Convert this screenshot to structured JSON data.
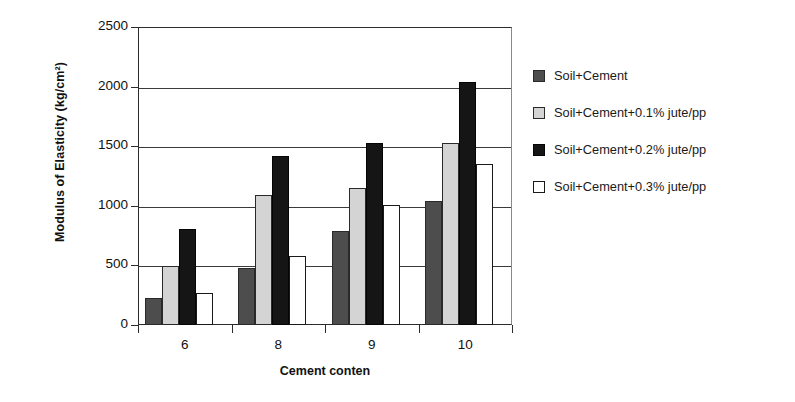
{
  "chart_data": {
    "type": "bar",
    "title": "",
    "xlabel": "Cement conten",
    "ylabel": "Modulus of Elasticity (kg/cm²)",
    "categories": [
      "6",
      "8",
      "9",
      "10"
    ],
    "ylim": [
      0,
      2500
    ],
    "yticks": [
      0,
      500,
      1000,
      1500,
      2000,
      2500
    ],
    "ytick_labels": [
      "0",
      "500",
      "1000",
      "1500",
      "2000",
      "2500"
    ],
    "grid": "horizontal",
    "legend_position": "right",
    "series": [
      {
        "name": "Soil+Cement",
        "color": "#4d4d4d",
        "values": [
          225,
          480,
          790,
          1040
        ]
      },
      {
        "name": "Soil+Cement+0.1% jute/pp",
        "color": "#d4d4d4",
        "values": [
          495,
          1090,
          1150,
          1525
        ]
      },
      {
        "name": "Soil+Cement+0.2% jute/pp",
        "color": "#151515",
        "values": [
          805,
          1415,
          1525,
          2035
        ]
      },
      {
        "name": "Soil+Cement+0.3% jute/pp",
        "color": "#ffffff",
        "values": [
          265,
          580,
          1010,
          1350
        ]
      }
    ]
  }
}
